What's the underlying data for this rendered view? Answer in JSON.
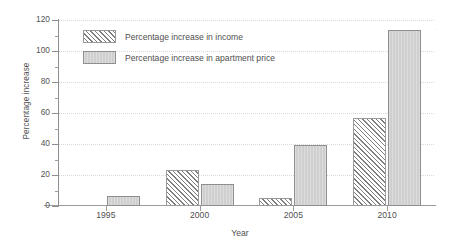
{
  "chart_data": {
    "type": "bar",
    "title": "",
    "xlabel": "Year",
    "ylabel": "Percentage increase",
    "categories": [
      "1995",
      "2000",
      "2005",
      "2010"
    ],
    "series": [
      {
        "name": "Percentage increase in income",
        "values": [
          0,
          23.5,
          5,
          57
        ],
        "pattern": "diagonal-hatch",
        "color": "#ffffff",
        "edge_color": "#9a9a9a"
      },
      {
        "name": "Percentage increase in apartment price",
        "values": [
          6.5,
          14.5,
          39.5,
          113.5
        ],
        "pattern": "solid-fill",
        "color": "#cfcfcf",
        "edge_color": "#8f8f8f"
      }
    ],
    "ylim": [
      0,
      120
    ],
    "ytick_major": [
      0,
      20,
      40,
      60,
      80,
      100,
      120
    ],
    "ytick_minor": [
      10,
      30,
      50,
      70,
      90,
      110
    ],
    "ytick_labels": [
      "0",
      "20",
      "40",
      "60",
      "80",
      "100",
      "120"
    ],
    "grid": true,
    "grid_style": "dotted",
    "grid_axis": "y",
    "legend_position": "upper-left-inside",
    "bar_group_labels": [
      "1995",
      "2000",
      "2005",
      "2010"
    ]
  },
  "legend": {
    "entries": [
      {
        "label": "Percentage increase in income",
        "swatch": "hatched-swatch"
      },
      {
        "label": "Percentage increase in apartment price",
        "swatch": "gray-swatch"
      }
    ]
  },
  "artifact": {
    "mark": "·"
  }
}
